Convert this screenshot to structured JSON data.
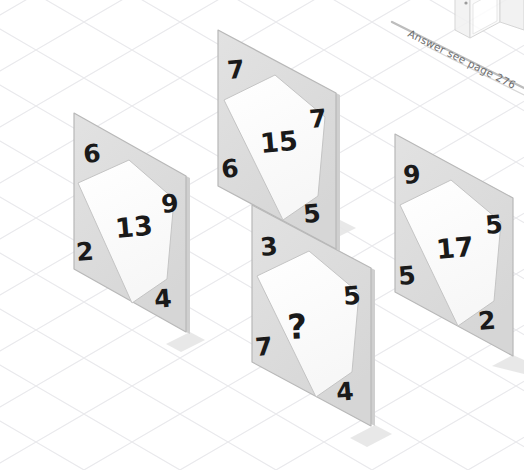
{
  "page": {
    "kind": "visual-logic-puzzle",
    "answer_note": "Answer see page 276",
    "background": "#ffffff",
    "grid_color": "#e9e9ec",
    "panel_frame_color": "#dcdcdc",
    "panel_face_color": "#fcfcfc",
    "panel_outline_color": "#b8b8b8",
    "number_color": "#1a1a1a",
    "shadow_color": "#e4e4e4"
  },
  "puzzle": {
    "question_symbol": "?",
    "panels": [
      {
        "id": "panel-1",
        "center": "13",
        "corners": {
          "top": "6",
          "right": "9",
          "left": "2",
          "bottom": "4"
        }
      },
      {
        "id": "panel-2",
        "center": "15",
        "corners": {
          "top": "7",
          "right": "7",
          "left": "6",
          "bottom": "5"
        }
      },
      {
        "id": "panel-3",
        "center": "?",
        "corners": {
          "top": "3",
          "right": "5",
          "left": "7",
          "bottom": "4"
        }
      },
      {
        "id": "panel-4",
        "center": "17",
        "corners": {
          "top": "9",
          "right": "5",
          "left": "5",
          "bottom": "2"
        }
      }
    ]
  }
}
